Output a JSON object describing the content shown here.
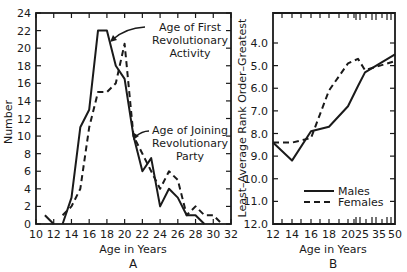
{
  "chart_data": [
    {
      "type": "line",
      "panel_label": "A",
      "title": "",
      "xlabel": "Age in Years",
      "ylabel": "Number",
      "xlim": [
        10,
        32
      ],
      "ylim": [
        0,
        24
      ],
      "x_ticks": [
        10,
        12,
        14,
        16,
        18,
        20,
        22,
        24,
        26,
        28,
        30,
        32
      ],
      "y_ticks": [
        0,
        2,
        4,
        6,
        8,
        10,
        12,
        14,
        16,
        18,
        20,
        22,
        24
      ],
      "grid": false,
      "series": [
        {
          "name": "Age of First Revolutionary Activity",
          "style": "solid",
          "x": [
            13,
            14,
            15,
            16,
            17,
            18,
            19,
            20,
            21,
            22,
            23,
            24,
            25,
            26,
            27,
            28,
            29
          ],
          "values": [
            0,
            3,
            11,
            13,
            22,
            22,
            18,
            16.5,
            10,
            6,
            7.5,
            2,
            4,
            3,
            1,
            1,
            0
          ]
        },
        {
          "name": "Age of Joining Revolutionary Party",
          "style": "dashed",
          "x": [
            13,
            14,
            15,
            16,
            17,
            18,
            19,
            20,
            21,
            22,
            23,
            24,
            25,
            26,
            27,
            28,
            29,
            30,
            31
          ],
          "values": [
            1,
            2,
            4,
            11,
            15,
            15,
            16,
            20.5,
            10,
            8,
            6,
            4,
            6,
            5,
            1,
            2,
            1,
            1,
            0
          ]
        },
        {
          "name": "Early outlier segment",
          "style": "solid",
          "x": [
            11,
            12
          ],
          "values": [
            1,
            0
          ]
        }
      ],
      "annotations": [
        {
          "text_lines": [
            "Age of First",
            "Revolutionary",
            "Activity"
          ],
          "points_to": [
            18.5,
            21
          ]
        },
        {
          "text_lines": [
            "Age of Joining",
            "Revolutionary",
            "Party"
          ],
          "points_to": [
            21,
            10
          ]
        }
      ]
    },
    {
      "type": "line",
      "panel_label": "B",
      "title": "",
      "xlabel": "Age in Years",
      "ylabel": "Least–Average Rank Order–Greatest",
      "x_tick_labels": [
        "12",
        "14",
        "16",
        "18",
        "20",
        "25",
        "35",
        "50"
      ],
      "y_ticks": [
        4.0,
        5.0,
        6.0,
        7.0,
        8.0,
        9.0,
        10.0,
        11.0,
        12.0
      ],
      "ylim": [
        12.0,
        3.5
      ],
      "y_inverted": true,
      "x_axis_breaks": true,
      "grid": false,
      "legend_position": "lower-left inside",
      "series": [
        {
          "name": "Males",
          "style": "solid",
          "x": [
            12,
            14,
            16,
            18,
            20,
            22,
            25,
            50
          ],
          "values": [
            8.4,
            9.2,
            7.9,
            7.7,
            6.8,
            5.9,
            5.3,
            4.5
          ]
        },
        {
          "name": "Females",
          "style": "dashed",
          "x": [
            12,
            14,
            16,
            18,
            20,
            22,
            25,
            50
          ],
          "values": [
            8.4,
            8.4,
            8.2,
            6.1,
            4.9,
            4.7,
            5.2,
            4.8
          ]
        }
      ]
    }
  ],
  "panelA": {
    "ylabel": "Number",
    "xlabel": "Age in Years",
    "label": "A",
    "y_tick_labels": [
      "0",
      "2",
      "4",
      "6",
      "8",
      "10",
      "12",
      "14",
      "16",
      "18",
      "20",
      "22",
      "24"
    ],
    "x_tick_labels": [
      "10",
      "12",
      "14",
      "16",
      "18",
      "20",
      "22",
      "24",
      "26",
      "28",
      "30",
      "32"
    ],
    "annot1": [
      "Age of First",
      "Revolutionary",
      "Activity"
    ],
    "annot2": [
      "Age of Joining",
      "Revolutionary",
      "Party"
    ]
  },
  "panelB": {
    "ylabel": "Least–Average Rank Order–Greatest",
    "xlabel": "Age in Years",
    "label": "B",
    "y_tick_labels": [
      "4.0",
      "5.0",
      "6.0",
      "7.0",
      "8.0",
      "9.0",
      "10.0",
      "11.0",
      "12.0"
    ],
    "x_tick_labels": [
      "12",
      "14",
      "16",
      "18",
      "20",
      "25",
      "35",
      "50"
    ],
    "legend": {
      "males": "Males",
      "females": "Females"
    }
  }
}
